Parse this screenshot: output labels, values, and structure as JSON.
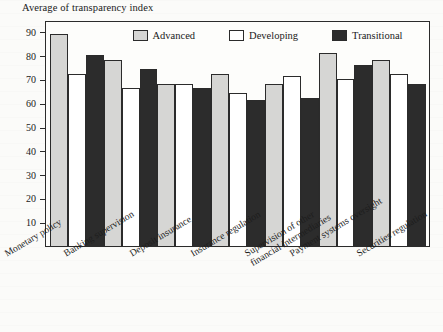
{
  "chart_data": {
    "type": "bar",
    "title": "Average of transparency index",
    "xlabel": "",
    "ylabel": "",
    "ylim": [
      0,
      95
    ],
    "yticks": [
      10,
      20,
      30,
      40,
      50,
      60,
      70,
      80,
      90
    ],
    "grid": false,
    "legend_position": "top-inside",
    "categories": [
      "Monetary policy",
      "Banking supervision",
      "Deposit insurance",
      "Insurance regulation",
      "Supervision of other financial intermediaries",
      "Payment systems oversight",
      "Securities regulation"
    ],
    "series": [
      {
        "name": "Advanced",
        "color": "#d6d6d4",
        "values": [
          90,
          79,
          69,
          73,
          69,
          82,
          79
        ]
      },
      {
        "name": "Developing",
        "color": "#ffffff",
        "values": [
          73,
          67,
          69,
          65,
          72,
          71,
          73
        ]
      },
      {
        "name": "Transitional",
        "color": "#2c2c2c",
        "values": [
          81,
          75,
          67,
          62,
          63,
          77,
          69
        ]
      }
    ]
  },
  "legend": {
    "items": [
      {
        "label": "Advanced"
      },
      {
        "label": "Developing"
      },
      {
        "label": "Transitional"
      }
    ]
  },
  "x_axis": {
    "labels": [
      {
        "line1": "Monetary policy",
        "line2": ""
      },
      {
        "line1": "Banking supervision",
        "line2": ""
      },
      {
        "line1": "Deposit insurance",
        "line2": ""
      },
      {
        "line1": "Insurance regulation",
        "line2": ""
      },
      {
        "line1": "Supervision of other",
        "line2": "financial intermediaries"
      },
      {
        "line1": "Payment systems oversight",
        "line2": ""
      },
      {
        "line1": "Securities regulation",
        "line2": ""
      }
    ]
  }
}
